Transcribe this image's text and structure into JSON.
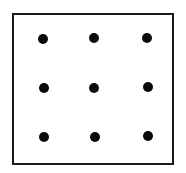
{
  "diagram": {
    "type": "dot-grid",
    "frame": {
      "border_color": "#1a1a1a",
      "background": "#ffffff"
    },
    "rows": 3,
    "cols": 3,
    "dot_color": "#0a0a0a",
    "dots": [
      {
        "row": 1,
        "col": 1,
        "x": 43,
        "y": 39
      },
      {
        "row": 1,
        "col": 2,
        "x": 94,
        "y": 38
      },
      {
        "row": 1,
        "col": 3,
        "x": 147,
        "y": 38
      },
      {
        "row": 2,
        "col": 1,
        "x": 44,
        "y": 88
      },
      {
        "row": 2,
        "col": 2,
        "x": 94,
        "y": 88
      },
      {
        "row": 2,
        "col": 3,
        "x": 148,
        "y": 87
      },
      {
        "row": 3,
        "col": 1,
        "x": 44,
        "y": 137
      },
      {
        "row": 3,
        "col": 2,
        "x": 95,
        "y": 137
      },
      {
        "row": 3,
        "col": 3,
        "x": 148,
        "y": 136
      }
    ]
  }
}
